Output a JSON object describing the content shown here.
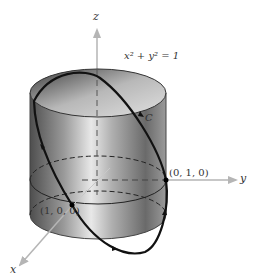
{
  "figure": {
    "axes": {
      "x_label": "x",
      "y_label": "y",
      "z_label": "z"
    },
    "equation_label": "x² + y² = 1",
    "curve_label": "C",
    "points": [
      {
        "label": "(0, 1, 0)"
      },
      {
        "label": "(1, 0, 0)"
      }
    ],
    "colors": {
      "axis": "#b5b5b5",
      "curve": "#111111",
      "cylinder_dark": "#5a5a5a",
      "cylinder_light": "#e6e6e6",
      "text": "#333333"
    }
  }
}
